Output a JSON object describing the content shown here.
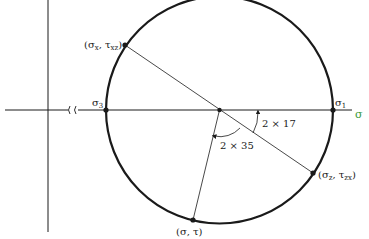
{
  "diagram": {
    "type": "mohr-circle",
    "colors": {
      "ink": "#1a1a1a",
      "axis_label": "#3a9a3a",
      "background": "#ffffff"
    },
    "axis": {
      "sigma_label": "σ",
      "break_symbol": "≀≀"
    },
    "points": {
      "sigma3": {
        "base": "σ",
        "sub": "3"
      },
      "sigma1": {
        "base": "σ",
        "sub": "1"
      },
      "p_x": {
        "open": "(",
        "s": "σ",
        "s_sub": "x",
        "sep": ", ",
        "t": "τ",
        "t_sub": "xz",
        "close": ")"
      },
      "p_z": {
        "open": "(",
        "s": "σ",
        "s_sub": "z",
        "sep": ", ",
        "t": "τ",
        "t_sub": "zx",
        "close": ")"
      },
      "p_general": {
        "text": "(σ, τ)"
      }
    },
    "angles": {
      "small": "2 × 17",
      "large": "2 × 35"
    }
  }
}
